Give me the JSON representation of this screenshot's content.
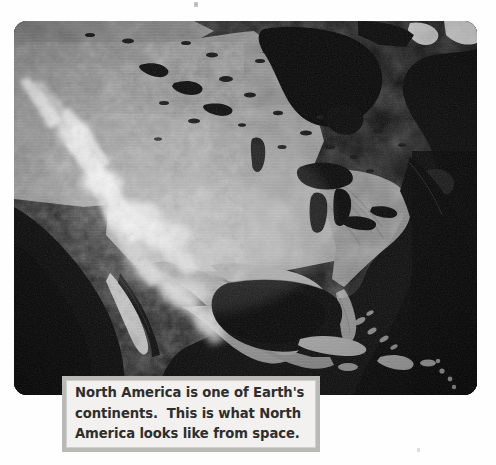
{
  "page": {
    "background_color": "#fefefe",
    "type": "scanned-textbook-page"
  },
  "photo": {
    "alt_title": "North America from space",
    "kind": "satellite-photograph",
    "palette": "black-and-white",
    "ocean_color": "#141414",
    "land_color": "#8d8d8d",
    "snow_color": "#f2f2f2",
    "features": [
      "Hudson Bay",
      "Great Lakes",
      "Rocky Mountains",
      "Baja California",
      "Gulf of California",
      "Gulf of Mexico",
      "Florida Peninsula",
      "Yucatan Peninsula",
      "Cuba",
      "Caribbean Islands",
      "Atlantic Ocean",
      "Pacific Ocean"
    ]
  },
  "caption": {
    "line1": "North America is one of Earth's",
    "line2": "continents.  This is what North",
    "line3": "America looks like from space.",
    "full_text": "North America is one of Earth's continents.  This is what North America looks like from space.",
    "text_color": "#2e2e2e",
    "background_color": "#f2f1ef",
    "border_color": "#b9b9b7"
  }
}
